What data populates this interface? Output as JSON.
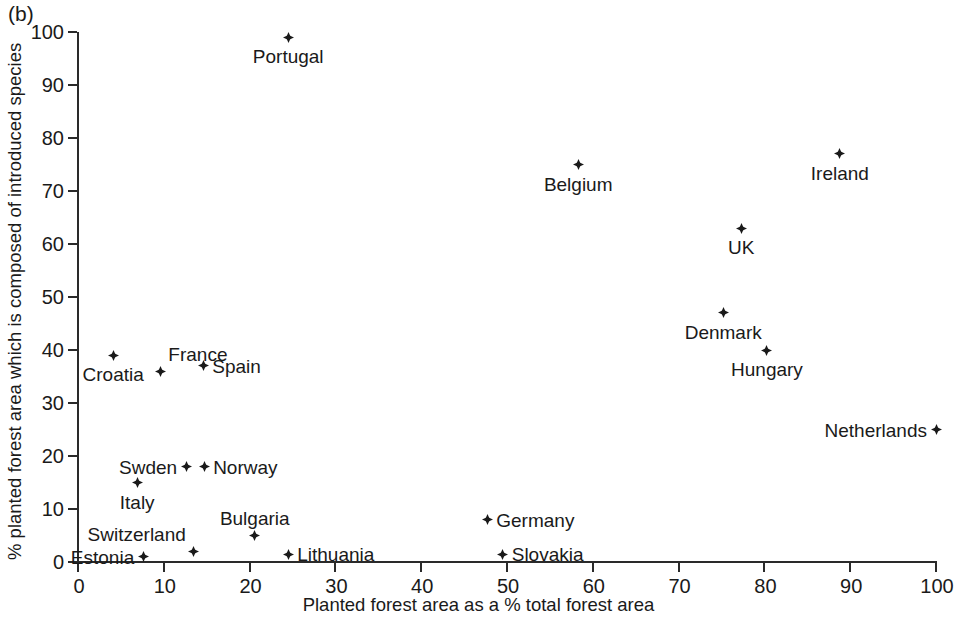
{
  "panel_label": "(b)",
  "chart_data": {
    "type": "scatter",
    "title": "",
    "xlabel": "Planted forest area as a % total forest area",
    "ylabel": "% planted forest area which is composed of introduced species",
    "xlim": [
      0,
      100
    ],
    "ylim": [
      0,
      100
    ],
    "xticks": [
      0,
      10,
      20,
      30,
      40,
      50,
      60,
      70,
      80,
      90,
      100
    ],
    "yticks": [
      0,
      10,
      20,
      30,
      40,
      50,
      60,
      70,
      80,
      90,
      100
    ],
    "xtick_labels": [
      "0",
      "10",
      "20",
      "30",
      "40",
      "50",
      "60",
      "70",
      "80",
      "90",
      "100"
    ],
    "ytick_labels": [
      "0",
      "10",
      "20",
      "30",
      "40",
      "50",
      "60",
      "70",
      "80",
      "90",
      "100"
    ],
    "grid": false,
    "legend": false,
    "marker": "diamond",
    "marker_color": "#1a1a1a",
    "points": [
      {
        "label": "Portugal",
        "x": 24.5,
        "y": 99.0,
        "label_pos": "below"
      },
      {
        "label": "Belgium",
        "x": 58.3,
        "y": 75.0,
        "label_pos": "below"
      },
      {
        "label": "Ireland",
        "x": 88.8,
        "y": 77.0,
        "label_pos": "below"
      },
      {
        "label": "UK",
        "x": 77.3,
        "y": 63.0,
        "label_pos": "below"
      },
      {
        "label": "Denmark",
        "x": 75.2,
        "y": 47.0,
        "label_pos": "below"
      },
      {
        "label": "Hungary",
        "x": 80.3,
        "y": 40.0,
        "label_pos": "below"
      },
      {
        "label": "Netherlands",
        "x": 100.0,
        "y": 25.0,
        "label_pos": "left"
      },
      {
        "label": "Croatia",
        "x": 4.1,
        "y": 39.0,
        "label_pos": "below"
      },
      {
        "label": "France",
        "x": 9.6,
        "y": 36.0,
        "label_pos": "above-right"
      },
      {
        "label": "Spain",
        "x": 14.6,
        "y": 37.0,
        "label_pos": "right"
      },
      {
        "label": "Swden",
        "x": 12.6,
        "y": 18.0,
        "label_pos": "left"
      },
      {
        "label": "Norway",
        "x": 14.7,
        "y": 18.0,
        "label_pos": "right"
      },
      {
        "label": "Italy",
        "x": 6.9,
        "y": 15.0,
        "label_pos": "below"
      },
      {
        "label": "Bulgaria",
        "x": 20.6,
        "y": 5.0,
        "label_pos": "above"
      },
      {
        "label": "Switzerland",
        "x": 13.5,
        "y": 2.0,
        "label_pos": "above-left"
      },
      {
        "label": "Estonia",
        "x": 7.6,
        "y": 1.0,
        "label_pos": "left"
      },
      {
        "label": "Lithuania",
        "x": 24.5,
        "y": 1.5,
        "label_pos": "right"
      },
      {
        "label": "Germany",
        "x": 47.7,
        "y": 8.0,
        "label_pos": "right"
      },
      {
        "label": "Slovakia",
        "x": 49.5,
        "y": 1.5,
        "label_pos": "right"
      }
    ]
  }
}
